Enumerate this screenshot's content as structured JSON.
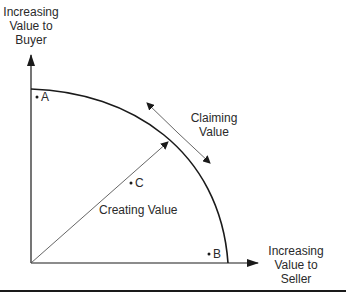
{
  "diagram": {
    "y_axis_label": [
      "Increasing",
      "Value to",
      "Buyer"
    ],
    "x_axis_label": [
      "Increasing",
      "Value to",
      "Seller"
    ],
    "points": [
      {
        "id": "A",
        "label": "A"
      },
      {
        "id": "B",
        "label": "B"
      },
      {
        "id": "C",
        "label": "C"
      }
    ],
    "annotations": {
      "claiming": [
        "Claiming",
        "Value"
      ],
      "creating": "Creating Value"
    },
    "colors": {
      "line": "#1a1a1a",
      "thin_line": "#555555",
      "text": "#2a2a2a"
    }
  }
}
